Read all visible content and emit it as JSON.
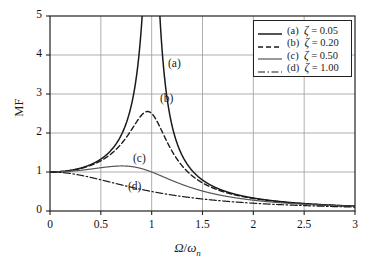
{
  "chart_data": {
    "type": "line",
    "title": "",
    "xlabel": "Ω/ωn",
    "ylabel": "MF",
    "xlim": [
      0,
      3
    ],
    "ylim": [
      0,
      5
    ],
    "xticks": [
      "0",
      "0.5",
      "1",
      "1.5",
      "2",
      "2.5",
      "3"
    ],
    "yticks": [
      "0",
      "1",
      "2",
      "3",
      "4",
      "5"
    ],
    "grid": true,
    "legend_position": "upper-right",
    "formula": "MF = 1/sqrt((1-r^2)^2 + (2*zeta*r)^2)",
    "x": [
      0,
      0.1,
      0.2,
      0.3,
      0.4,
      0.5,
      0.6,
      0.7,
      0.75,
      0.8,
      0.85,
      0.9,
      0.925,
      0.95,
      0.96,
      0.97,
      0.98,
      0.99,
      1,
      1.01,
      1.02,
      1.03,
      1.04,
      1.05,
      1.075,
      1.1,
      1.15,
      1.2,
      1.3,
      1.4,
      1.5,
      1.6,
      1.7,
      1.8,
      1.9,
      2,
      2.2,
      2.4,
      2.6,
      2.8,
      3
    ],
    "series": [
      {
        "name": "(a)",
        "zeta": 0.05,
        "label": "(a)  ζ = 0.05",
        "style": "solid",
        "color": "#1a1a1a",
        "width": 1.5,
        "peak_value": 10.01,
        "peak_x": 0.9975,
        "values": [
          1,
          1.0101,
          1.0417,
          1.0989,
          1.1903,
          1.3311,
          1.5576,
          1.9516,
          2.2759,
          2.7586,
          3.4906,
          4.6384,
          5.4621,
          6.4417,
          6.8438,
          7.2395,
          7.6104,
          7.9289,
          8.1648,
          8.2926,
          8.2979,
          8.1843,
          7.9702,
          7.6817,
          6.8401,
          5.9586,
          4.4646,
          3.4551,
          2.2835,
          1.6894,
          1.3332,
          1.0968,
          0.9283,
          0.8022,
          0.7044,
          0.6262,
          0.5088,
          0.4263,
          0.3656,
          0.3191,
          0.2824
        ]
      },
      {
        "name": "(b)",
        "zeta": 0.2,
        "label": "(b)  ζ = 0.20",
        "style": "dashed",
        "color": "#1a1a1a",
        "width": 1.4,
        "peak_value": 2.5516,
        "peak_x": 0.9592,
        "values": [
          1,
          1.0098,
          1.0386,
          1.0845,
          1.1425,
          1.2019,
          1.2427,
          1.2394,
          1.2107,
          1.1654,
          1.1081,
          1.0442,
          1.0111,
          0.9781,
          0.965,
          0.9521,
          0.9393,
          0.9266,
          0.9141,
          0.9017,
          0.8895,
          0.8774,
          0.8655,
          0.8538,
          0.825,
          0.797,
          0.7437,
          0.6942,
          0.6061,
          0.5318,
          0.4693,
          0.4166,
          0.3719,
          0.3339,
          0.3013,
          0.2732,
          0.2277,
          0.1926,
          0.1653,
          0.1437,
          0.1263
        ]
      },
      {
        "name": "(c)",
        "zeta": 0.5,
        "label": "(c)  ζ = 0.50",
        "style": "solid",
        "color": "#555555",
        "width": 1.2,
        "peak_value": 1.1547,
        "peak_x": 0.7071,
        "values": [
          1,
          1.0099,
          1.0376,
          1.0784,
          1.1228,
          1.1547,
          1.1547,
          1.1094,
          1.0701,
          1.0233,
          0.9716,
          0.918,
          0.8913,
          0.8651,
          0.8547,
          0.8445,
          0.8343,
          0.8243,
          0.8944,
          0.8047,
          0.7951,
          0.7857,
          0.7763,
          0.7671,
          0.7445,
          0.7225,
          0.6805,
          0.6415,
          0.5717,
          0.5118,
          0.4607,
          0.417,
          0.3794,
          0.3469,
          0.3187,
          0.294,
          0.253,
          0.2206,
          0.1946,
          0.1734,
          0.1558
        ]
      },
      {
        "name": "(d)",
        "zeta": 1.0,
        "label": "(d)  ζ = 1.00",
        "style": "dashdot",
        "color": "#1a1a1a",
        "width": 1.2,
        "peak_value": 1.0,
        "peak_x": 0,
        "values": [
          1,
          0.9901,
          0.9615,
          0.9174,
          0.8621,
          0.8,
          0.7353,
          0.6711,
          0.64,
          0.6098,
          0.5807,
          0.5525,
          0.5391,
          0.5263,
          0.5208,
          0.5154,
          0.5101,
          0.5049,
          0.5,
          0.495,
          0.4902,
          0.4854,
          0.4808,
          0.4762,
          0.4651,
          0.4545,
          0.4357,
          0.4167,
          0.3846,
          0.3559,
          0.3333,
          0.3125,
          0.2941,
          0.2778,
          0.2632,
          0.25,
          0.2273,
          0.2083,
          0.1923,
          0.1786,
          0.1667
        ]
      }
    ]
  },
  "legend": {
    "items": [
      {
        "tag": "(a)",
        "zeta_symbol": "ζ",
        "text": "(a)  ζ = 0.05",
        "value": "0.05"
      },
      {
        "tag": "(b)",
        "zeta_symbol": "ζ",
        "text": "(b)  ζ = 0.20",
        "value": "0.20"
      },
      {
        "tag": "(c)",
        "zeta_symbol": "ζ",
        "text": "(c)  ζ = 0.50",
        "value": "0.50"
      },
      {
        "tag": "(d)",
        "zeta_symbol": "ζ",
        "text": "(d)  ζ = 1.00",
        "value": "1.00"
      }
    ]
  },
  "curve_tags": [
    {
      "label": "(a)",
      "x_px": 168,
      "y_px": 57
    },
    {
      "label": "(b)",
      "x_px": 160,
      "y_px": 92
    },
    {
      "label": "(c)",
      "x_px": 133,
      "y_px": 152
    },
    {
      "label": "(d)",
      "x_px": 128,
      "y_px": 180
    }
  ],
  "axes": {
    "y_title": "MF",
    "x_title_parts": {
      "omega_cap": "Ω",
      "slash": "/",
      "omega_low": "ω",
      "sub": "n"
    },
    "yticks": [
      "5",
      "4",
      "3",
      "2",
      "1",
      "0"
    ],
    "xticks": [
      "0",
      "0.5",
      "1",
      "1.5",
      "2",
      "2.5",
      "3"
    ]
  },
  "colors": {
    "axis": "#222222",
    "grid": "#9a9a9a",
    "curve_dark": "#1a1a1a",
    "curve_gray": "#555555",
    "background": "#ffffff"
  }
}
